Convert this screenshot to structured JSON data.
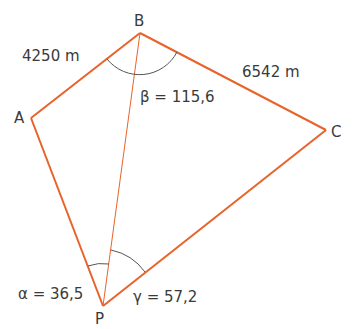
{
  "diagram": {
    "points": {
      "A": {
        "label": "A"
      },
      "B": {
        "label": "B"
      },
      "C": {
        "label": "C"
      },
      "P": {
        "label": "P"
      }
    },
    "distances": {
      "AB": "4250 m",
      "BC": "6542 m"
    },
    "angles": {
      "alpha": "α = 36,5",
      "beta": "β = 115,6",
      "gamma": "γ = 57,2"
    },
    "colors": {
      "line": "#e8632a",
      "arc": "#555555",
      "text": "#3a3a3a"
    }
  }
}
